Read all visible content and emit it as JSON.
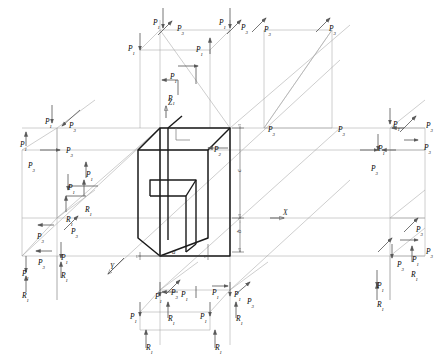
{
  "figure": {
    "type": "isometric-force-diagram",
    "title": ""
  },
  "axes": [
    {
      "name": "z-axis",
      "label": "Z",
      "x": 168,
      "y": 104,
      "dir": "up"
    },
    {
      "name": "x-axis",
      "label": "X",
      "x": 283,
      "y": 214,
      "dir": "right"
    },
    {
      "name": "y-axis",
      "label": "Y",
      "x": 110,
      "y": 268,
      "dir": "down-left"
    }
  ],
  "dimensions": [
    {
      "name": "dim-a",
      "label": "a",
      "x": 172,
      "y": 255,
      "orient": "horizontal"
    },
    {
      "name": "dim-b",
      "label": "b",
      "x": 236,
      "y": 238,
      "orient": "vertical"
    },
    {
      "name": "dim-c",
      "label": "c",
      "x": 236,
      "y": 175,
      "orient": "vertical"
    }
  ],
  "body_label": {
    "base": "P",
    "sub": "2",
    "x": 214,
    "y": 144
  },
  "force_symbols": {
    "force": "P",
    "reaction": "R"
  },
  "labels": [
    {
      "base": "P",
      "sub": "1",
      "x": 153,
      "y": 11
    },
    {
      "base": "P",
      "sub": "3",
      "x": 177,
      "y": 17
    },
    {
      "base": "P",
      "sub": "1",
      "x": 219,
      "y": 11
    },
    {
      "base": "P",
      "sub": "3",
      "x": 241,
      "y": 16
    },
    {
      "base": "P",
      "sub": "3",
      "x": 264,
      "y": 18
    },
    {
      "base": "P",
      "sub": "3",
      "x": 329,
      "y": 17
    },
    {
      "base": "P",
      "sub": "1",
      "x": 128,
      "y": 37
    },
    {
      "base": "P",
      "sub": "1",
      "x": 196,
      "y": 38
    },
    {
      "base": "P",
      "sub": "1",
      "x": 170,
      "y": 65
    },
    {
      "base": "P",
      "sub": "1",
      "x": 168,
      "y": 87
    },
    {
      "base": "P",
      "sub": "1",
      "x": 45,
      "y": 110
    },
    {
      "base": "P",
      "sub": "3",
      "x": 69,
      "y": 114
    },
    {
      "base": "P",
      "sub": "1",
      "x": 20,
      "y": 133
    },
    {
      "base": "P",
      "sub": "3",
      "x": 66,
      "y": 139
    },
    {
      "base": "P",
      "sub": "3",
      "x": 28,
      "y": 154
    },
    {
      "base": "P",
      "sub": "1",
      "x": 86,
      "y": 163
    },
    {
      "base": "P",
      "sub": "1",
      "x": 68,
      "y": 176
    },
    {
      "base": "R",
      "sub": "1",
      "x": 85,
      "y": 198
    },
    {
      "base": "R",
      "sub": "1",
      "x": 66,
      "y": 208
    },
    {
      "base": "P",
      "sub": "3",
      "x": 37,
      "y": 225
    },
    {
      "base": "P",
      "sub": "3",
      "x": 71,
      "y": 220
    },
    {
      "base": "P",
      "sub": "1",
      "x": 61,
      "y": 246
    },
    {
      "base": "P",
      "sub": "3",
      "x": 38,
      "y": 251
    },
    {
      "base": "P",
      "sub": "1",
      "x": 22,
      "y": 262
    },
    {
      "base": "R",
      "sub": "1",
      "x": 61,
      "y": 264
    },
    {
      "base": "R",
      "sub": "1",
      "x": 22,
      "y": 284
    },
    {
      "base": "P",
      "sub": "3",
      "x": 268,
      "y": 118
    },
    {
      "base": "P",
      "sub": "3",
      "x": 338,
      "y": 118
    },
    {
      "base": "P",
      "sub": "1",
      "x": 393,
      "y": 113
    },
    {
      "base": "P",
      "sub": "3",
      "x": 426,
      "y": 114
    },
    {
      "base": "P",
      "sub": "3",
      "x": 424,
      "y": 136
    },
    {
      "base": "P",
      "sub": "1",
      "x": 378,
      "y": 137
    },
    {
      "base": "P",
      "sub": "3",
      "x": 371,
      "y": 157
    },
    {
      "base": "P",
      "sub": "3",
      "x": 416,
      "y": 218
    },
    {
      "base": "P",
      "sub": "3",
      "x": 426,
      "y": 240
    },
    {
      "base": "P",
      "sub": "1",
      "x": 412,
      "y": 248
    },
    {
      "base": "P",
      "sub": "3",
      "x": 397,
      "y": 253
    },
    {
      "base": "R",
      "sub": "1",
      "x": 411,
      "y": 263
    },
    {
      "base": "P",
      "sub": "1",
      "x": 377,
      "y": 274
    },
    {
      "base": "R",
      "sub": "1",
      "x": 377,
      "y": 293
    },
    {
      "base": "P",
      "sub": "1",
      "x": 155,
      "y": 285
    },
    {
      "base": "P",
      "sub": "3",
      "x": 171,
      "y": 281
    },
    {
      "base": "P",
      "sub": "1",
      "x": 181,
      "y": 283
    },
    {
      "base": "P",
      "sub": "1",
      "x": 212,
      "y": 281
    },
    {
      "base": "P",
      "sub": "1",
      "x": 234,
      "y": 283
    },
    {
      "base": "P",
      "sub": "3",
      "x": 247,
      "y": 290
    },
    {
      "base": "P",
      "sub": "1",
      "x": 130,
      "y": 305
    },
    {
      "base": "R",
      "sub": "1",
      "x": 168,
      "y": 307
    },
    {
      "base": "P",
      "sub": "1",
      "x": 200,
      "y": 305
    },
    {
      "base": "R",
      "sub": "1",
      "x": 236,
      "y": 307
    },
    {
      "base": "R",
      "sub": "1",
      "x": 146,
      "y": 336
    },
    {
      "base": "R",
      "sub": "1",
      "x": 215,
      "y": 336
    }
  ],
  "colors": {
    "body_stroke": "#1a1a1a",
    "construction_stroke": "#9a9a9a",
    "arrow_stroke": "#444444",
    "label_text": "#2b2b2b",
    "background": "#ffffff"
  }
}
